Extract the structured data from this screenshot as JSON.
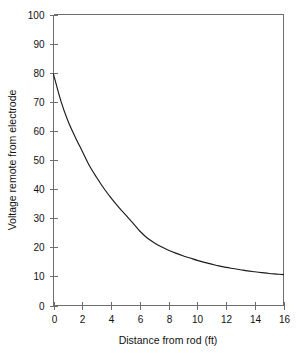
{
  "chart_data": {
    "type": "line",
    "title": "",
    "subtitle": "",
    "xlabel": "Distance from rod (ft)",
    "ylabel": "Voltage remote from electrode",
    "xlim": [
      0,
      16
    ],
    "ylim": [
      0,
      100
    ],
    "xticks": [
      0,
      2,
      4,
      6,
      8,
      10,
      12,
      14,
      16
    ],
    "yticks": [
      0,
      10,
      20,
      30,
      40,
      50,
      60,
      70,
      80,
      90,
      100
    ],
    "xtick_labels": [
      "0",
      "2",
      "4",
      "6",
      "8",
      "10",
      "12",
      "14",
      "16"
    ],
    "ytick_labels": [
      "0",
      "10",
      "20",
      "30",
      "40",
      "50",
      "60",
      "70",
      "80",
      "90",
      "100"
    ],
    "grid": false,
    "legend": false,
    "legend_position": "none",
    "annotations": [],
    "series": [
      {
        "name": "Voltage remote from electrode",
        "color": "#1b1b1b",
        "x": [
          0,
          0.5,
          1,
          1.5,
          2,
          2.5,
          3,
          3.5,
          4,
          4.5,
          5,
          5.5,
          6,
          6.5,
          7,
          7.5,
          8,
          8.5,
          9,
          9.5,
          10,
          10.5,
          11,
          11.5,
          12,
          12.5,
          13,
          13.5,
          14,
          14.5,
          15,
          15.5,
          16
        ],
        "y": [
          79.5,
          70.5,
          63.5,
          58.0,
          53.0,
          48.0,
          44.0,
          40.3,
          37.0,
          34.0,
          31.2,
          28.5,
          25.6,
          23.3,
          21.6,
          20.2,
          19.0,
          18.0,
          17.1,
          16.3,
          15.5,
          14.8,
          14.2,
          13.6,
          13.1,
          12.7,
          12.3,
          11.9,
          11.6,
          11.3,
          11.0,
          10.8,
          10.6
        ]
      }
    ]
  },
  "axes": {
    "y_title": "Voltage remote from electrode",
    "x_title": "Distance from rod (ft)"
  }
}
